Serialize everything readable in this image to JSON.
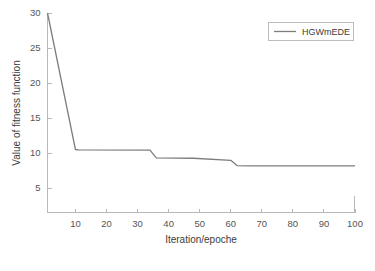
{
  "chart_data": {
    "type": "line",
    "title": "",
    "xlabel": "Iteration/epoche",
    "ylabel": "Value of fitness function",
    "xlim": [
      1,
      100
    ],
    "ylim": [
      1.5,
      30
    ],
    "grid": false,
    "legend_position": "top-right",
    "xticks": [
      10,
      20,
      30,
      40,
      50,
      60,
      70,
      80,
      90,
      100
    ],
    "xtick_labels": [
      "10",
      "20",
      "30",
      "40",
      "50",
      "60",
      "70",
      "80",
      "90",
      "100"
    ],
    "yticks": [
      5,
      10,
      15,
      20,
      25,
      30
    ],
    "ytick_labels": [
      "5",
      "10",
      "15",
      "20",
      "25",
      "30"
    ],
    "series": [
      {
        "name": "HGWmEDE",
        "color": "#7d7d7d",
        "x": [
          1,
          10,
          11,
          34,
          36,
          48,
          60,
          62,
          66,
          100
        ],
        "values": [
          30.0,
          10.5,
          10.45,
          10.4,
          9.3,
          9.25,
          8.95,
          8.2,
          8.15,
          8.15
        ]
      }
    ]
  },
  "legend": {
    "entries": [
      {
        "label": "HGWmEDE"
      }
    ]
  },
  "axes": {
    "x_title": "Iteration/epoche",
    "y_title": "Value of fitness function"
  }
}
